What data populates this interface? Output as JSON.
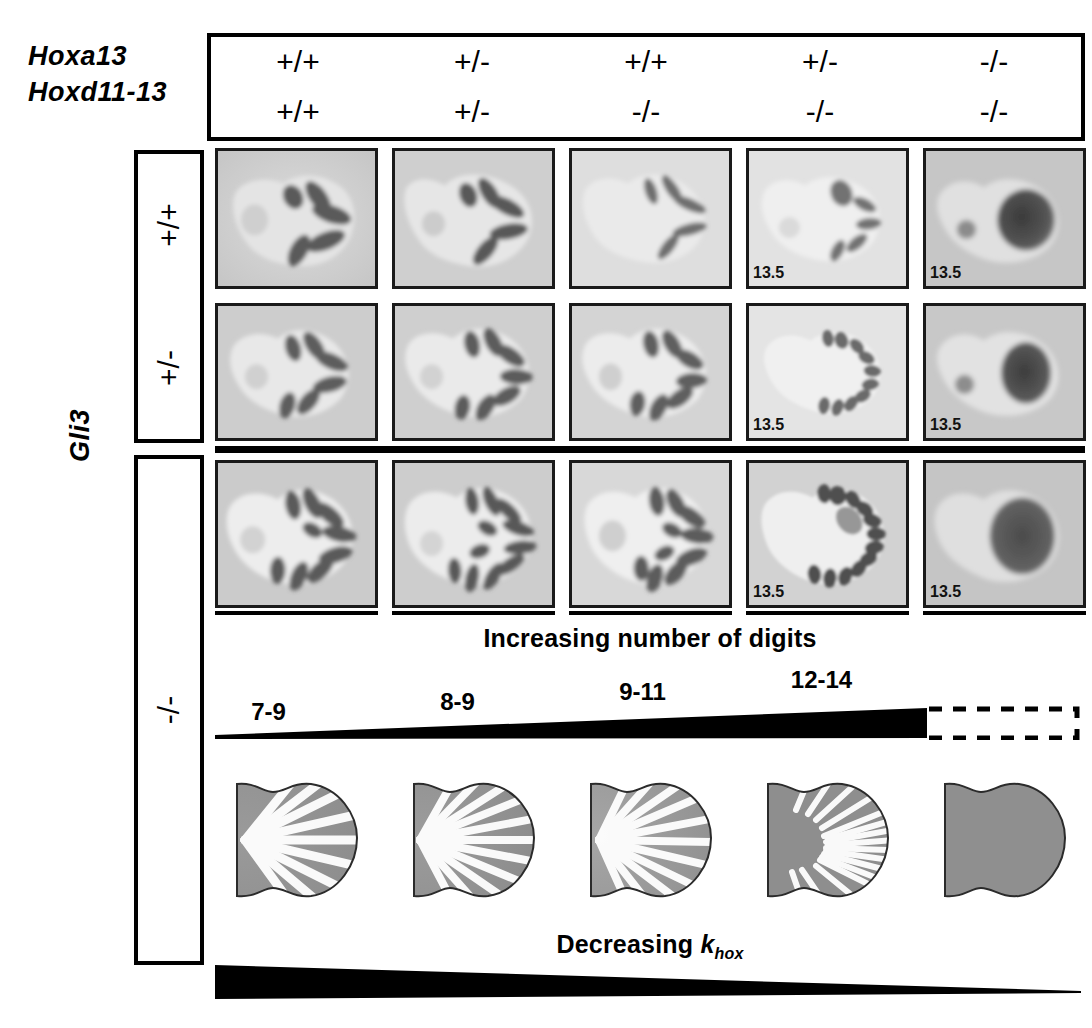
{
  "figure": {
    "row_header_genes": [
      "Hoxa13",
      "Hoxd11-13"
    ],
    "side_axis_label": "Gli3"
  },
  "columns": [
    {
      "hoxa13": "+/+",
      "hoxd11_13": "+/+",
      "digit_count": "7-9"
    },
    {
      "hoxa13": "+/-",
      "hoxd11_13": "+/-",
      "digit_count": "8-9"
    },
    {
      "hoxa13": "+/+",
      "hoxd11_13": "-/-",
      "digit_count": "9-11"
    },
    {
      "hoxa13": "+/-",
      "hoxd11_13": "-/-",
      "digit_count": "12-14"
    },
    {
      "hoxa13": "-/-",
      "hoxd11_13": "-/-",
      "digit_count": ""
    }
  ],
  "gli3_rows": [
    {
      "genotype": "+/+"
    },
    {
      "genotype": "+/-"
    },
    {
      "genotype": "-/-"
    }
  ],
  "panels": {
    "row1": [
      {
        "stage": "",
        "digits": 5,
        "pattern": "discrete-digits"
      },
      {
        "stage": "",
        "digits": 5,
        "pattern": "discrete-digits"
      },
      {
        "stage": "",
        "digits": 5,
        "pattern": "thin-digits"
      },
      {
        "stage": "13.5",
        "digits": 5,
        "pattern": "thin-digits"
      },
      {
        "stage": "13.5",
        "digits": 0,
        "pattern": "fused-mass"
      }
    ],
    "row2": [
      {
        "stage": "",
        "digits": 6,
        "pattern": "discrete-digits"
      },
      {
        "stage": "",
        "digits": 7,
        "pattern": "discrete-digits"
      },
      {
        "stage": "",
        "digits": 7,
        "pattern": "discrete-digits"
      },
      {
        "stage": "13.5",
        "digits": 10,
        "pattern": "many-digits"
      },
      {
        "stage": "13.5",
        "digits": 0,
        "pattern": "fused-mass"
      }
    ],
    "row3": [
      {
        "stage": "",
        "digits": 9,
        "pattern": "many-digits"
      },
      {
        "stage": "",
        "digits": 11,
        "pattern": "many-digits"
      },
      {
        "stage": "",
        "digits": 10,
        "pattern": "many-digits"
      },
      {
        "stage": "13.5",
        "digits": 13,
        "pattern": "many-digits"
      },
      {
        "stage": "13.5",
        "digits": 0,
        "pattern": "fused-mass"
      }
    ]
  },
  "simulations": [
    {
      "stripes": 9,
      "pattern": "turing-stripes"
    },
    {
      "stripes": 11,
      "pattern": "turing-stripes"
    },
    {
      "stripes": 11,
      "pattern": "turing-stripes"
    },
    {
      "stripes": 16,
      "pattern": "turing-stripes"
    },
    {
      "stripes": 0,
      "pattern": "uniform"
    }
  ],
  "annotations": {
    "digits_caption": "Increasing number of digits",
    "khox_caption_prefix": "Decreasing ",
    "khox_symbol": "k",
    "khox_subscript": "hox"
  },
  "colors": {
    "ink": "#000000",
    "panel_background": "#c9c9c9",
    "panel_background_light": "#d9d9d9",
    "digit_dark": "#4a4a4a",
    "sim_fill": "#8f8f8f",
    "sim_stripe": "#ffffff",
    "sim_outline": "#2b2b2b"
  }
}
